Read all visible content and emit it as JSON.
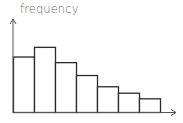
{
  "chart_data": {
    "type": "bar",
    "title": "",
    "xlabel": "",
    "ylabel": "frequency",
    "categories": [
      "1",
      "2",
      "3",
      "4",
      "5",
      "6",
      "7"
    ],
    "values": [
      69,
      81,
      62,
      46,
      32,
      24,
      17
    ],
    "ylim": [
      0,
      100
    ],
    "grid": false,
    "legend": null,
    "bar_style": {
      "fill": "#ffffff",
      "stroke": "#2a2a2a"
    },
    "axis_color": "#555555"
  }
}
